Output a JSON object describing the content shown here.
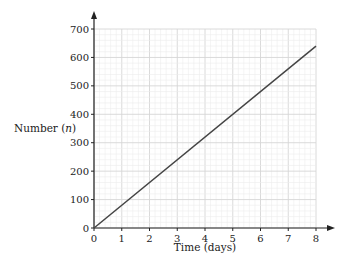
{
  "chart_data": {
    "type": "line",
    "title": "",
    "xlabel": "Time (days)",
    "ylabel": "Number (n)",
    "ylabel_parts": {
      "text": "Number (",
      "var": "n",
      "close": ")"
    },
    "xlim": [
      0,
      8
    ],
    "ylim": [
      0,
      700
    ],
    "x_ticks": [
      "0",
      "1",
      "2",
      "3",
      "4",
      "5",
      "6",
      "7",
      "8"
    ],
    "y_ticks": [
      "0",
      "100",
      "200",
      "300",
      "400",
      "500",
      "600",
      "700"
    ],
    "grid": true,
    "series": [
      {
        "name": "n",
        "x": [
          0,
          8
        ],
        "y": [
          0,
          640
        ],
        "color": "#444444"
      }
    ]
  }
}
